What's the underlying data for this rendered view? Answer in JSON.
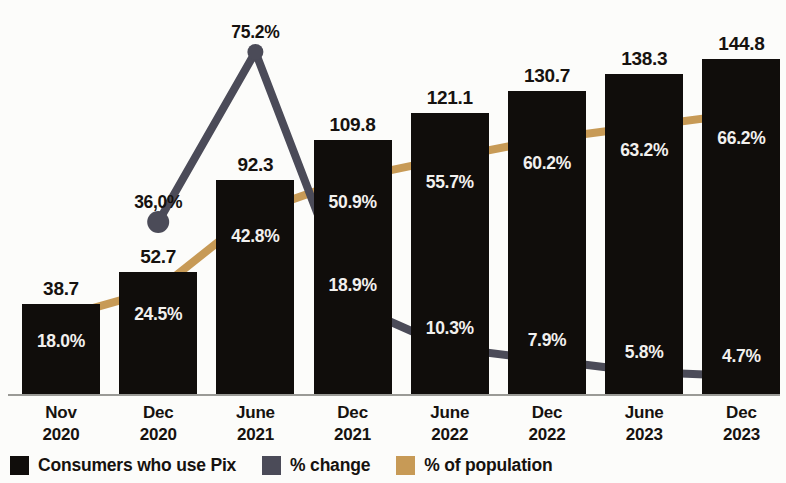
{
  "chart_data": {
    "type": "bar",
    "title": "",
    "subtitle": "",
    "xlabel": "",
    "ylabel": "",
    "grid": false,
    "legend_position": "bottom-left",
    "categories": [
      {
        "month": "Nov",
        "year": "2020"
      },
      {
        "month": "Dec",
        "year": "2020"
      },
      {
        "month": "June",
        "year": "2021"
      },
      {
        "month": "Dec",
        "year": "2021"
      },
      {
        "month": "June",
        "year": "2022"
      },
      {
        "month": "Dec",
        "year": "2022"
      },
      {
        "month": "June",
        "year": "2023"
      },
      {
        "month": "Dec",
        "year": "2023"
      }
    ],
    "series": [
      {
        "name": "Consumers who use Pix",
        "type": "bar",
        "color": "#100d0b",
        "values": [
          38.7,
          52.7,
          92.3,
          109.8,
          121.1,
          130.7,
          138.3,
          144.8
        ],
        "labels": [
          "38.7",
          "52.7",
          "92.3",
          "109.8",
          "121.1",
          "130.7",
          "138.3",
          "144.8"
        ],
        "ylim": [
          0,
          158
        ]
      },
      {
        "name": "% change",
        "type": "line",
        "color": "#4b4b58",
        "values": [
          null,
          36.0,
          75.2,
          18.9,
          10.3,
          7.9,
          5.8,
          4.7
        ],
        "labels": [
          "",
          "36,0%",
          "75.2%",
          "18.9%",
          "10.3%",
          "7.9%",
          "5.8%",
          "4.7%"
        ]
      },
      {
        "name": "% of population",
        "type": "line",
        "color": "#c79a56",
        "values": [
          18.0,
          24.5,
          42.8,
          50.9,
          55.7,
          60.2,
          63.2,
          66.2
        ],
        "labels": [
          "18.0%",
          "24.5%",
          "42.8%",
          "50.9%",
          "55.7%",
          "60.2%",
          "63.2%",
          "66.2%"
        ]
      }
    ]
  },
  "legend": {
    "items": [
      {
        "label": "Consumers who use Pix",
        "color": "#100d0b"
      },
      {
        "label": "% change",
        "color": "#4b4b58"
      },
      {
        "label": "% of population",
        "color": "#c79a56"
      }
    ]
  },
  "colors": {
    "bar": "#100d0b",
    "change_line": "#4b4b58",
    "population_line": "#c79a56",
    "background": "#fcfcfa",
    "label_dark": "#16120f",
    "label_light": "#f2f0ee",
    "axis": "#9a9a96"
  }
}
